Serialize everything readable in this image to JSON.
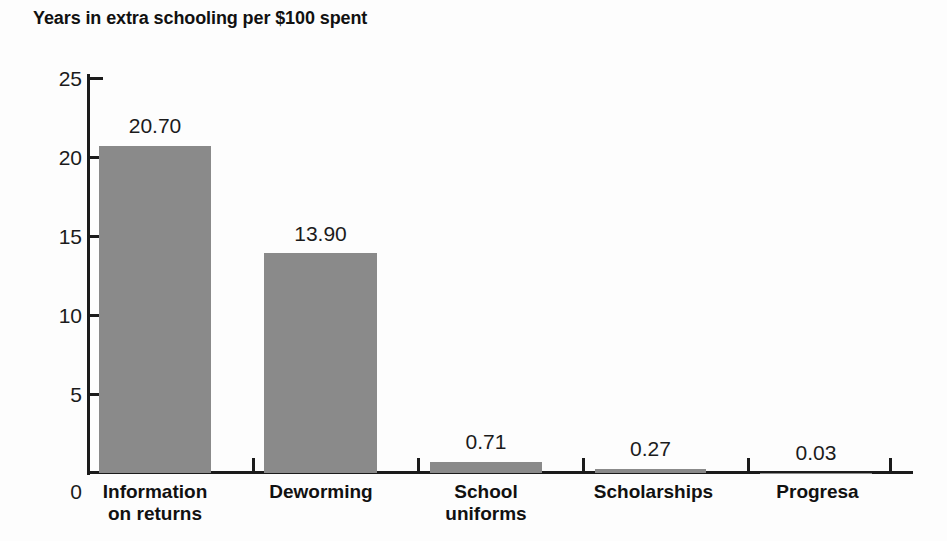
{
  "chart_data": {
    "type": "bar",
    "title": "Years in extra schooling per $100 spent",
    "xlabel": "",
    "ylabel": "",
    "ylim": [
      0,
      25
    ],
    "yticks": [
      0,
      5,
      10,
      15,
      20,
      25
    ],
    "ytick_labels": [
      "0",
      "5",
      "10",
      "15",
      "20",
      "25"
    ],
    "grid": false,
    "legend": false,
    "bar_color": "#8a8a8a",
    "axis_color": "#1b1b1b",
    "text_color": "#111111",
    "categories": [
      "Information on returns",
      "Deworming",
      "School uniforms",
      "Scholarships",
      "Progresa"
    ],
    "category_lines": [
      [
        "Information",
        "on returns"
      ],
      [
        "Deworming",
        ""
      ],
      [
        "School",
        "uniforms"
      ],
      [
        "Scholarships",
        ""
      ],
      [
        "Progresa",
        ""
      ]
    ],
    "values": [
      20.7,
      13.9,
      0.71,
      0.27,
      0.03
    ],
    "value_labels": [
      "20.70",
      "13.90",
      "0.71",
      "0.27",
      "0.03"
    ]
  }
}
